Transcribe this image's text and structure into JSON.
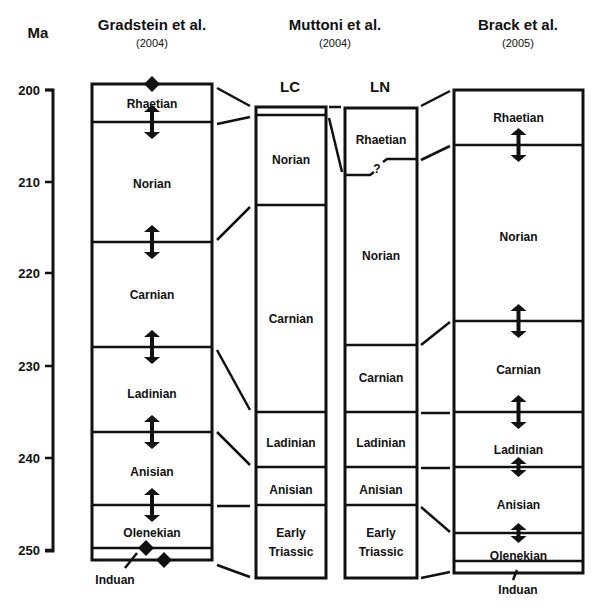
{
  "figure": {
    "unit_label": "Ma",
    "axis": {
      "x": 53,
      "y_top": 90,
      "y_bottom": 551,
      "ticks": [
        {
          "label": "200",
          "y": 90
        },
        {
          "label": "210",
          "y": 182
        },
        {
          "label": "220",
          "y": 273
        },
        {
          "label": "230",
          "y": 366
        },
        {
          "label": "240",
          "y": 458
        },
        {
          "label": "250",
          "y": 550
        }
      ]
    },
    "columns": [
      {
        "id": "gradstein",
        "title": "Gradstein et al.",
        "year": "(2004)",
        "title_x": 152,
        "x": 92,
        "w": 120,
        "top": 84,
        "bottom": 560,
        "boundaries": [
          122,
          242,
          347,
          432,
          505,
          548
        ],
        "stages": [
          {
            "name": "Rhaetian",
            "y": 104
          },
          {
            "name": "Norian",
            "y": 184
          },
          {
            "name": "Carnian",
            "y": 295
          },
          {
            "name": "Ladinian",
            "y": 394
          },
          {
            "name": "Anisian",
            "y": 472
          },
          {
            "name": "Olenekian",
            "y": 533
          }
        ],
        "arrows": [
          {
            "y": 122,
            "double": true
          },
          {
            "y": 242,
            "double": true
          },
          {
            "y": 347,
            "double": true
          },
          {
            "y": 432,
            "double": true
          },
          {
            "y": 505,
            "double": true
          }
        ],
        "diamonds": [
          {
            "x": 152,
            "y": 84
          },
          {
            "x": 146,
            "y": 548
          },
          {
            "x": 164,
            "y": 560
          }
        ],
        "footnote": {
          "name": "Induan",
          "x": 115,
          "y": 584,
          "leader": [
            [
              125,
              568
            ],
            [
              137,
              553
            ]
          ]
        }
      },
      {
        "id": "muttoni-lc",
        "title": "LC",
        "title_x": 290,
        "x": 256,
        "w": 70,
        "top": 107,
        "bottom": 578,
        "boundaries": [
          115,
          205,
          412,
          467,
          505
        ],
        "stages": [
          {
            "name": "Norian",
            "y": 160
          },
          {
            "name": "Carnian",
            "y": 319
          },
          {
            "name": "Ladinian",
            "y": 443
          },
          {
            "name": "Anisian",
            "y": 490
          },
          {
            "name": "Early",
            "y": 533
          },
          {
            "name": "Triassic",
            "y": 552
          }
        ]
      },
      {
        "id": "muttoni-ln",
        "title": "LN",
        "title_x": 380,
        "x": 345,
        "w": 72,
        "top": 108,
        "bottom": 578,
        "boundaries": [
          345,
          412,
          467,
          505
        ],
        "stepped_boundary": {
          "left_y": 175,
          "right_y": 159,
          "mark": "?"
        },
        "stages": [
          {
            "name": "Rhaetian",
            "y": 140
          },
          {
            "name": "Norian",
            "y": 256
          },
          {
            "name": "Carnian",
            "y": 378
          },
          {
            "name": "Ladinian",
            "y": 443
          },
          {
            "name": "Anisian",
            "y": 490
          },
          {
            "name": "Early",
            "y": 533
          },
          {
            "name": "Triassic",
            "y": 552
          }
        ]
      },
      {
        "id": "brack",
        "title": "Brack et al.",
        "year": "(2005)",
        "title_x": 518,
        "x": 454,
        "w": 129,
        "top": 90,
        "bottom": 573,
        "boundaries": [
          145,
          321,
          412,
          467,
          533,
          561
        ],
        "stages": [
          {
            "name": "Rhaetian",
            "y": 118
          },
          {
            "name": "Norian",
            "y": 237
          },
          {
            "name": "Carnian",
            "y": 370
          },
          {
            "name": "Ladinian",
            "y": 450
          },
          {
            "name": "Anisian",
            "y": 505
          },
          {
            "name": "Olenekian",
            "y": 556
          }
        ],
        "arrows": [
          {
            "y": 145,
            "double": true
          },
          {
            "y": 321,
            "double": true
          },
          {
            "y": 412,
            "double": true
          },
          {
            "y": 467,
            "double": true,
            "small": true
          },
          {
            "y": 533,
            "double": true,
            "small": true
          }
        ],
        "footnote": {
          "name": "Induan",
          "x": 518,
          "y": 594,
          "leader": [
            [
              513,
              580
            ],
            [
              517,
              570
            ]
          ]
        }
      }
    ],
    "muttoni_header": {
      "title": "Muttoni et al.",
      "year": "(2004)",
      "x": 335
    },
    "connectors": [
      [
        [
          217,
          88
        ],
        [
          250,
          106
        ]
      ],
      [
        [
          217,
          124
        ],
        [
          250,
          117
        ]
      ],
      [
        [
          217,
          240
        ],
        [
          250,
          207
        ]
      ],
      [
        [
          217,
          350
        ],
        [
          250,
          410
        ]
      ],
      [
        [
          217,
          432
        ],
        [
          250,
          465
        ]
      ],
      [
        [
          217,
          506
        ],
        [
          250,
          506
        ]
      ],
      [
        [
          217,
          565
        ],
        [
          250,
          577
        ]
      ],
      [
        [
          329,
          107
        ],
        [
          341,
          107
        ]
      ],
      [
        [
          329,
          118
        ],
        [
          342,
          172
        ]
      ],
      [
        [
          421,
          106
        ],
        [
          450,
          91
        ]
      ],
      [
        [
          421,
          160
        ],
        [
          450,
          146
        ]
      ],
      [
        [
          421,
          345
        ],
        [
          450,
          322
        ]
      ],
      [
        [
          421,
          413
        ],
        [
          450,
          413
        ]
      ],
      [
        [
          421,
          468
        ],
        [
          450,
          468
        ]
      ],
      [
        [
          421,
          507
        ],
        [
          450,
          532
        ]
      ],
      [
        [
          421,
          578
        ],
        [
          450,
          572
        ]
      ]
    ]
  }
}
